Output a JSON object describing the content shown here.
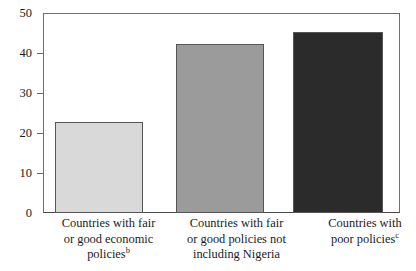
{
  "chart_data": {
    "type": "bar",
    "title": "",
    "subtitle": "",
    "xlabel": "",
    "ylabel": "",
    "ylim": [
      0,
      50
    ],
    "yticks": [
      0,
      10,
      20,
      30,
      40,
      50
    ],
    "ytick_labels": [
      "0",
      "10",
      "20",
      "30",
      "40",
      "50"
    ],
    "grid": false,
    "legend": "none",
    "categories": [
      "Countries with fair or good economic policies",
      "Countries with fair or good policies not including Nigeria",
      "Countries with poor policies"
    ],
    "category_lines": [
      [
        "Countries with fair",
        "or good economic",
        "policies"
      ],
      [
        "Countries with fair",
        "or good policies not",
        "including Nigeria"
      ],
      [
        "Countries with",
        "poor policies"
      ]
    ],
    "category_footnotes": [
      "b",
      "",
      "c"
    ],
    "values": [
      22.7,
      42.2,
      45.3
    ],
    "bar_colors": [
      "#d9d9d9",
      "#9b9b9b",
      "#2b2b2b"
    ],
    "bar_border_color": "#555555",
    "axis_color": "#6f6f6f",
    "text_color": "#1a1a1a",
    "background": "#ffffff"
  },
  "axis": {
    "y_max": 50,
    "y_min": 0
  },
  "bars": [
    {
      "name": "bar-fair-or-good-economic-policies",
      "value": 22.7,
      "color": "#d9d9d9",
      "left_pct": 3.4,
      "width_pct": 24.6
    },
    {
      "name": "bar-fair-or-good-policies-excluding-nigeria",
      "value": 42.2,
      "color": "#9b9b9b",
      "left_pct": 37.3,
      "width_pct": 24.6
    },
    {
      "name": "bar-poor-policies",
      "value": 45.3,
      "color": "#2b2b2b",
      "left_pct": 70.0,
      "width_pct": 25.2
    }
  ],
  "labels": {
    "cat1_line1": "Countries with fair",
    "cat1_line2": "or good economic",
    "cat1_line3": "policies",
    "cat1_sup": "b",
    "cat2_line1": "Countries with fair",
    "cat2_line2": "or good policies not",
    "cat2_line3": "including Nigeria",
    "cat3_line1": "Countries with",
    "cat3_line2": "poor policies",
    "cat3_sup": "c"
  },
  "yaxis_labels": {
    "t0": "0",
    "t10": "10",
    "t20": "20",
    "t30": "30",
    "t40": "40",
    "t50": "50"
  }
}
